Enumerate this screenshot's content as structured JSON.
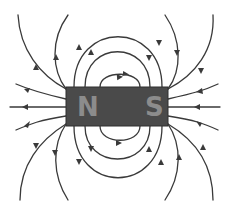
{
  "diagram": {
    "colors": {
      "background": "#ffffff",
      "field_line": "#3a3a3a",
      "magnet_body": "#4a4a4a",
      "magnet_label": "#8c8c8c"
    },
    "magnet": {
      "north_label": "N",
      "south_label": "S",
      "x": 66,
      "y": 87,
      "width": 102,
      "height": 39
    },
    "field_lines": {
      "direction": "from N pole to S pole (arrows point away from N, toward S)",
      "count_top_loops": 3,
      "count_bottom_loops": 3,
      "count_open_lines_per_side": 5
    }
  }
}
